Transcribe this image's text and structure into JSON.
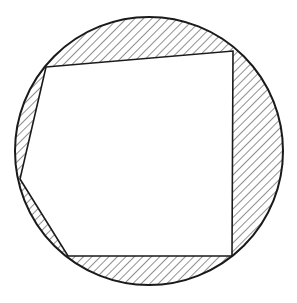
{
  "diagram": {
    "background": "#ffffff",
    "stroke_color": "#1a1a1a",
    "hatch_color": "#333333",
    "circle": {
      "cx": 149,
      "cy": 151,
      "r": 134
    },
    "polygon": {
      "vertices": [
        {
          "name": "top-left",
          "x": 46,
          "y": 67
        },
        {
          "name": "top-right",
          "x": 233,
          "y": 51
        },
        {
          "name": "bottom-right",
          "x": 232,
          "y": 256
        },
        {
          "name": "bottom-left",
          "x": 68,
          "y": 256
        },
        {
          "name": "left",
          "x": 20,
          "y": 179
        }
      ],
      "fill": "#ffffff"
    },
    "hatching": {
      "angle_deg": 45,
      "spacing": 6,
      "region": "circle minus polygon"
    }
  }
}
